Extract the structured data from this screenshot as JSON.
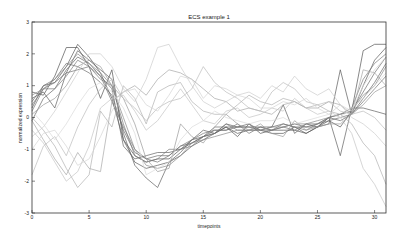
{
  "chart_data": {
    "type": "line",
    "title": "ECS example 1",
    "xlabel": "timepoints",
    "ylabel": "normalized expression",
    "xlim": [
      0,
      31
    ],
    "ylim": [
      -3,
      3
    ],
    "xticks": [
      0,
      5,
      10,
      15,
      20,
      25,
      30
    ],
    "yticks": [
      3,
      2,
      1,
      0,
      -1,
      -2,
      -3
    ],
    "grid": false,
    "legend": null,
    "x": [
      0,
      1,
      2,
      3,
      4,
      5,
      6,
      7,
      8,
      9,
      10,
      11,
      12,
      13,
      14,
      15,
      16,
      17,
      18,
      19,
      20,
      21,
      22,
      23,
      24,
      25,
      26,
      27,
      28,
      29,
      30,
      31
    ],
    "series": [
      {
        "name": "gene 1",
        "color": "#555555",
        "values": [
          0.8,
          0.7,
          1.3,
          2.2,
          2.2,
          1.6,
          0.6,
          1.5,
          -0.7,
          -1.2,
          -1.4,
          -1.3,
          -1.3,
          -1.0,
          -0.8,
          -0.6,
          -0.5,
          -0.3,
          -0.6,
          -0.2,
          -0.5,
          -0.4,
          -0.4,
          -0.4,
          -0.5,
          -0.3,
          -0.1,
          -0.3,
          0.2,
          2.1,
          2.3,
          2.3
        ]
      },
      {
        "name": "gene 2",
        "color": "#5a5a5a",
        "values": [
          0.3,
          1.0,
          1.1,
          1.6,
          2.3,
          1.9,
          1.4,
          0.6,
          -0.7,
          -1.4,
          -1.6,
          -1.5,
          -1.4,
          -1.2,
          -0.9,
          -0.7,
          -0.5,
          -0.3,
          -0.5,
          -0.4,
          -0.4,
          -0.5,
          -0.5,
          -0.3,
          -0.5,
          -0.3,
          -0.2,
          1.5,
          0.1,
          1.0,
          1.8,
          2.2
        ]
      },
      {
        "name": "gene 3",
        "color": "#606060",
        "values": [
          0.6,
          0.8,
          0.3,
          1.4,
          2.1,
          1.8,
          1.5,
          1.2,
          -0.5,
          -1.5,
          -1.9,
          -2.2,
          -1.4,
          -1.1,
          -0.7,
          -0.4,
          -0.5,
          -0.2,
          -0.3,
          -0.2,
          -0.4,
          -0.3,
          0.4,
          -0.5,
          -0.2,
          -0.3,
          0.0,
          -1.2,
          0.3,
          0.3,
          0.2,
          0.1
        ]
      },
      {
        "name": "gene 4",
        "color": "#666666",
        "values": [
          -0.1,
          0.6,
          0.9,
          1.5,
          1.9,
          1.7,
          1.3,
          0.9,
          -0.9,
          -1.3,
          -1.2,
          -1.1,
          -1.1,
          -1.0,
          -0.7,
          -0.6,
          -0.4,
          -0.4,
          -0.3,
          -0.3,
          -0.3,
          -0.3,
          -0.2,
          -0.3,
          -0.3,
          -0.2,
          0.0,
          -0.1,
          0.1,
          0.6,
          1.1,
          1.7
        ]
      },
      {
        "name": "gene 5",
        "color": "#6d6d6d",
        "values": [
          0.5,
          1.0,
          1.2,
          1.7,
          1.6,
          1.4,
          1.1,
          0.7,
          -0.4,
          -1.1,
          -1.3,
          -1.2,
          -1.2,
          -0.9,
          -0.8,
          -0.6,
          -0.3,
          -0.3,
          -0.3,
          -0.3,
          -0.4,
          -0.4,
          -0.3,
          -0.2,
          -0.3,
          -0.3,
          0.0,
          0.1,
          0.2,
          0.8,
          1.4,
          1.9
        ]
      },
      {
        "name": "gene 6",
        "color": "#747474",
        "values": [
          0.2,
          0.9,
          1.1,
          1.4,
          1.5,
          1.6,
          1.3,
          0.5,
          -0.3,
          -1.0,
          -1.3,
          -1.4,
          -1.2,
          -0.9,
          -0.7,
          -0.5,
          -0.4,
          -0.4,
          -0.2,
          -0.5,
          -0.3,
          -0.4,
          -0.3,
          -0.4,
          -0.2,
          -0.2,
          -0.1,
          0.0,
          0.1,
          0.5,
          0.9,
          1.3
        ]
      },
      {
        "name": "gene 7",
        "color": "#7b7b7b",
        "values": [
          0.4,
          0.9,
          0.9,
          1.3,
          1.8,
          1.6,
          1.2,
          1.0,
          -0.2,
          -1.2,
          -1.4,
          -1.3,
          -1.0,
          -1.0,
          -0.9,
          -0.6,
          -0.5,
          -0.2,
          -0.4,
          -0.4,
          -0.3,
          -0.4,
          -0.2,
          -0.3,
          -0.4,
          -0.2,
          0.0,
          0.1,
          0.3,
          1.2,
          1.7,
          2.0
        ]
      },
      {
        "name": "gene 8",
        "color": "#8a8a8a",
        "values": [
          0.7,
          0.9,
          1.2,
          1.6,
          2.0,
          1.7,
          1.4,
          1.0,
          0.0,
          -1.0,
          -1.5,
          -1.6,
          -1.5,
          -1.2,
          -0.8,
          -0.7,
          -0.6,
          -0.5,
          -0.4,
          -0.4,
          -0.4,
          -0.3,
          -0.3,
          -0.2,
          -0.2,
          -0.1,
          0.0,
          0.1,
          0.2,
          0.7,
          1.0,
          1.6
        ]
      },
      {
        "name": "gene 9",
        "color": "#999999",
        "values": [
          0.1,
          0.4,
          0.6,
          1.0,
          1.6,
          1.8,
          1.6,
          1.0,
          0.6,
          -0.2,
          -1.3,
          -1.7,
          -1.6,
          -0.2,
          -0.6,
          -0.8,
          -0.3,
          0.1,
          -0.2,
          -0.4,
          -0.2,
          -0.5,
          -0.6,
          -0.1,
          -0.4,
          -0.3,
          -0.2,
          -0.2,
          0.1,
          0.4,
          0.8,
          1.0
        ]
      },
      {
        "name": "gene 10",
        "color": "#a8a8a8",
        "values": [
          -0.1,
          -0.7,
          -1.3,
          -1.8,
          -1.1,
          -1.6,
          -1.7,
          0.5,
          0.8,
          1.0,
          0.7,
          1.2,
          1.5,
          1.4,
          1.2,
          0.9,
          0.6,
          0.5,
          0.2,
          0.3,
          0.2,
          0.1,
          0.4,
          0.5,
          0.3,
          0.3,
          0.5,
          0.4,
          0.1,
          1.5,
          1.4,
          1.0
        ]
      },
      {
        "name": "gene 11",
        "color": "#b2b2b2",
        "values": [
          0.0,
          -0.4,
          -0.9,
          -1.6,
          -2.2,
          -1.8,
          0.2,
          -0.3,
          1.0,
          0.6,
          -0.2,
          0.8,
          1.0,
          1.1,
          0.5,
          0.2,
          0.1,
          0.1,
          0.4,
          0.7,
          0.5,
          0.4,
          0.6,
          0.5,
          0.3,
          0.4,
          0.2,
          0.1,
          -0.2,
          -0.8,
          -1.2,
          -2.1
        ]
      },
      {
        "name": "gene 12",
        "color": "#bcbcbc",
        "values": [
          -1.8,
          -0.9,
          -0.6,
          -1.2,
          -0.3,
          0.4,
          0.9,
          1.2,
          0.6,
          0.3,
          -0.1,
          0.3,
          0.5,
          0.6,
          0.9,
          1.6,
          1.1,
          0.8,
          0.6,
          0.3,
          0.2,
          0.8,
          1.1,
          0.9,
          0.5,
          0.4,
          0.5,
          0.2,
          0.1,
          0.2,
          0.0,
          -0.4
        ]
      },
      {
        "name": "gene 13",
        "color": "#c4c4c4",
        "values": [
          -0.4,
          -0.8,
          -1.4,
          -2.0,
          -1.7,
          -0.9,
          0.3,
          0.6,
          0.7,
          0.2,
          -0.4,
          -0.1,
          0.4,
          0.9,
          0.4,
          -0.1,
          -0.2,
          0.2,
          0.3,
          0.0,
          0.1,
          0.3,
          0.2,
          0.6,
          0.3,
          0.1,
          0.2,
          0.0,
          -0.5,
          -1.6,
          -2.1,
          -2.8
        ]
      },
      {
        "name": "gene 14",
        "color": "#cdcdcd",
        "values": [
          -0.6,
          -0.3,
          0.2,
          0.8,
          1.4,
          2.0,
          2.0,
          1.6,
          0.9,
          0.5,
          1.2,
          2.2,
          2.3,
          1.6,
          1.0,
          0.5,
          0.3,
          0.5,
          0.7,
          0.8,
          0.6,
          1.0,
          0.8,
          1.3,
          0.9,
          0.7,
          0.9,
          0.4,
          0.0,
          -0.2,
          -0.5,
          -0.9
        ]
      },
      {
        "name": "gene 15",
        "color": "#d4d4d4",
        "values": [
          -1.0,
          -0.5,
          -0.4,
          -0.9,
          -1.5,
          -1.3,
          -0.6,
          0.2,
          0.8,
          0.9,
          0.4,
          0.2,
          0.7,
          1.3,
          1.2,
          0.6,
          1.0,
          0.9,
          0.7,
          0.6,
          0.3,
          0.3,
          0.5,
          0.4,
          0.6,
          0.3,
          0.1,
          0.4,
          0.2,
          1.0,
          1.5,
          1.9
        ]
      },
      {
        "name": "gene 16",
        "color": "#dadada",
        "values": [
          0.2,
          -0.2,
          -0.7,
          -0.2,
          0.4,
          0.9,
          1.1,
          0.8,
          0.3,
          -0.5,
          -1.8,
          -1.6,
          -1.4,
          -0.7,
          -0.3,
          -0.1,
          0.2,
          0.0,
          -0.1,
          -0.2,
          -0.1,
          -0.1,
          0.0,
          -0.2,
          -0.1,
          0.0,
          0.1,
          0.0,
          0.3,
          0.6,
          1.0,
          1.4
        ]
      }
    ]
  }
}
